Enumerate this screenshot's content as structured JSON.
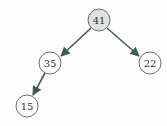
{
  "diagram": {
    "type": "binary-tree",
    "nodes": [
      {
        "id": "n41",
        "label": "41",
        "x": 99,
        "y": 20,
        "highlight": true
      },
      {
        "id": "n35",
        "label": "35",
        "x": 50,
        "y": 63,
        "highlight": false
      },
      {
        "id": "n22",
        "label": "22",
        "x": 150,
        "y": 63,
        "highlight": false
      },
      {
        "id": "n15",
        "label": "15",
        "x": 27,
        "y": 106,
        "highlight": false
      }
    ],
    "edges": [
      {
        "from": "41",
        "to": "35"
      },
      {
        "from": "41",
        "to": "22"
      },
      {
        "from": "35",
        "to": "15"
      }
    ],
    "colors": {
      "edge": "#3f5e4a",
      "node_fill_highlight": "#dde3dc",
      "node_fill": "#ffffff",
      "node_stroke": "#6b6b6b"
    }
  }
}
